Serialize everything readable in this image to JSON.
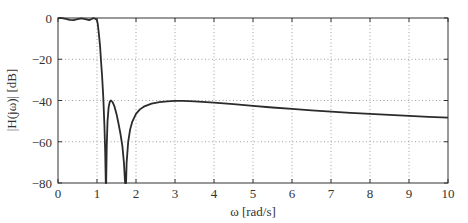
{
  "chart_data": {
    "type": "line",
    "title": "",
    "xlabel": "ω [rad/s]",
    "ylabel": "|H(jω)| [dB]",
    "xlim": [
      0,
      10
    ],
    "ylim": [
      -80,
      0
    ],
    "xticks": [
      0,
      1,
      2,
      3,
      4,
      5,
      6,
      7,
      8,
      9,
      10
    ],
    "yticks": [
      0,
      -20,
      -40,
      -60,
      -80
    ],
    "xtick_labels": [
      "0",
      "1",
      "2",
      "3",
      "4",
      "5",
      "6",
      "7",
      "8",
      "9",
      "10"
    ],
    "ytick_labels": [
      "0",
      "−20",
      "−40",
      "−60",
      "−80"
    ],
    "grid": true,
    "series": [
      {
        "name": "|H(jω)|",
        "color": "#2b2b2b",
        "x": [
          0,
          0.1,
          0.2,
          0.3,
          0.4,
          0.5,
          0.6,
          0.7,
          0.8,
          0.85,
          0.9,
          0.95,
          1.0,
          1.02,
          1.05,
          1.08,
          1.1,
          1.13,
          1.16,
          1.19,
          1.21,
          1.225,
          1.235,
          1.25,
          1.27,
          1.3,
          1.33,
          1.36,
          1.4,
          1.45,
          1.5,
          1.55,
          1.6,
          1.65,
          1.69,
          1.72,
          1.735,
          1.745,
          1.76,
          1.8,
          1.85,
          1.9,
          2.0,
          2.1,
          2.2,
          2.4,
          2.6,
          2.8,
          3.0,
          3.2,
          3.5,
          4.0,
          4.5,
          5.0,
          5.5,
          6.0,
          6.5,
          7.0,
          7.5,
          8.0,
          8.5,
          9.0,
          9.5,
          10.0
        ],
        "y": [
          0,
          -0.1,
          -0.4,
          -0.9,
          -1.0,
          -0.6,
          -0.2,
          -0.5,
          -1.0,
          -0.6,
          -0.1,
          -0.3,
          -1.0,
          -3,
          -8,
          -14,
          -20,
          -28,
          -38,
          -52,
          -65,
          -80,
          -80,
          -62,
          -50,
          -43,
          -40.5,
          -40,
          -40.8,
          -43,
          -46.5,
          -51,
          -56,
          -62,
          -70,
          -80,
          -80,
          -80,
          -70,
          -60,
          -54,
          -50.5,
          -46.5,
          -44.3,
          -43,
          -41.5,
          -40.8,
          -40.4,
          -40.2,
          -40.2,
          -40.4,
          -41,
          -41.8,
          -42.6,
          -43.4,
          -44.1,
          -44.8,
          -45.4,
          -46,
          -46.5,
          -47,
          -47.5,
          -47.9,
          -48.3
        ]
      }
    ]
  }
}
